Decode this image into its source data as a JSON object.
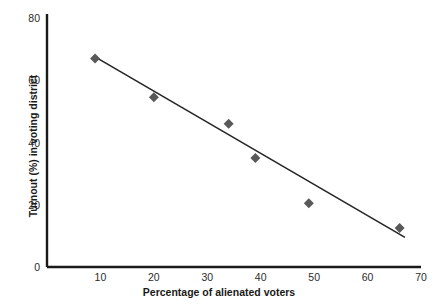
{
  "chart_data": {
    "type": "scatter",
    "title": "",
    "xlabel": "Percentage of alienated voters",
    "ylabel": "Turnout (%) in voting district",
    "xlim": [
      0,
      70
    ],
    "ylim": [
      0,
      80
    ],
    "xticks": [
      10,
      20,
      30,
      40,
      50,
      60,
      70
    ],
    "yticks": [
      0,
      20,
      40,
      60,
      80
    ],
    "xtick_labels": [
      "10",
      "20",
      "30",
      "40",
      "50",
      "60",
      "70"
    ],
    "ytick_labels": [
      "0",
      "20",
      "40",
      "60",
      "80"
    ],
    "grid": false,
    "legend": false,
    "marker": "diamond",
    "marker_color": "#595959",
    "line_color": "#262626",
    "axis_color": "#1a1a1a",
    "points": [
      {
        "x": 9,
        "y": 67
      },
      {
        "x": 20,
        "y": 54.5
      },
      {
        "x": 34,
        "y": 46
      },
      {
        "x": 39,
        "y": 35
      },
      {
        "x": 49,
        "y": 20.5
      },
      {
        "x": 66,
        "y": 12.5
      }
    ],
    "trendline": {
      "x_start": 9,
      "y_start": 67.5,
      "x_end": 67,
      "y_end": 9.5
    }
  }
}
